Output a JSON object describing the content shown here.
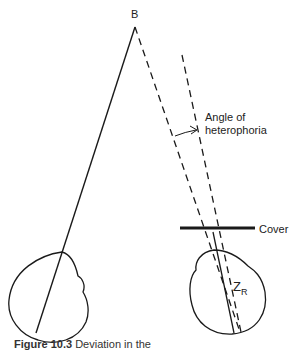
{
  "diagram": {
    "type": "heterophoria cover test diagram",
    "labels": {
      "apex": "B",
      "angle_line1": "Angle of",
      "angle_line2": "heterophoria",
      "cover": "Cover",
      "z_main": "Z",
      "z_sub": "R"
    },
    "caption": {
      "figure_number": "Figure 10.3",
      "text": "Deviation in the"
    },
    "colors": {
      "line": "#1a1a1a",
      "background": "#ffffff"
    }
  }
}
